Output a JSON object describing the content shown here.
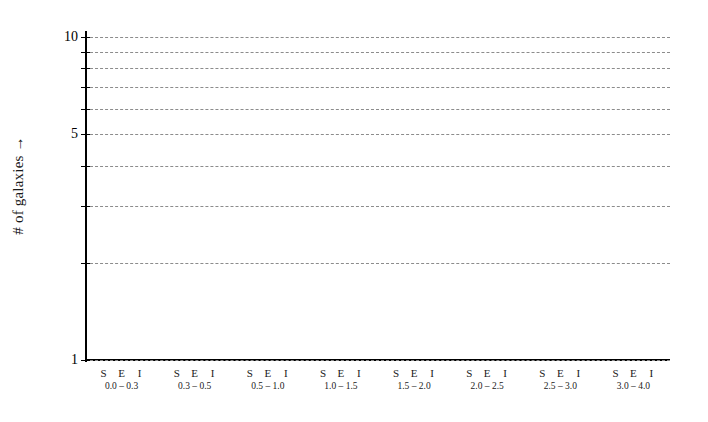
{
  "chart_data": {
    "type": "bar",
    "title": "",
    "subtitle": "",
    "xlabel": "",
    "ylabel": "# of galaxies →",
    "yscale": "log",
    "ylim": [
      1,
      10
    ],
    "grid": true,
    "legend": "none",
    "note": "Empty plot template: axes and gridlines drawn, no bars plotted (all series values are zero/absent).",
    "y_ticks": [
      1,
      2,
      3,
      4,
      5,
      6,
      7,
      8,
      9,
      10
    ],
    "y_tick_labels": [
      {
        "value": 10,
        "label": "10"
      },
      {
        "value": 9,
        "label": ""
      },
      {
        "value": 8,
        "label": ""
      },
      {
        "value": 7,
        "label": ""
      },
      {
        "value": 6,
        "label": ""
      },
      {
        "value": 5,
        "label": "5"
      },
      {
        "value": 4,
        "label": ""
      },
      {
        "value": 3,
        "label": ""
      },
      {
        "value": 2,
        "label": ""
      },
      {
        "value": 1,
        "label": "1"
      }
    ],
    "categories": [
      "0.0 – 0.3",
      "0.3 – 0.5",
      "0.5 – 1.0",
      "1.0 – 1.5",
      "1.5 – 2.0",
      "2.0 – 2.5",
      "2.5 – 3.0",
      "3.0 – 4.0"
    ],
    "subcategories": [
      "S",
      "E",
      "I"
    ],
    "series": [
      {
        "name": "S",
        "values": [
          null,
          null,
          null,
          null,
          null,
          null,
          null,
          null
        ]
      },
      {
        "name": "E",
        "values": [
          null,
          null,
          null,
          null,
          null,
          null,
          null,
          null
        ]
      },
      {
        "name": "I",
        "values": [
          null,
          null,
          null,
          null,
          null,
          null,
          null,
          null
        ]
      }
    ],
    "colors": {
      "axis": "#000000",
      "gridline": "#8c8c8c",
      "text": "#1a1a1a",
      "background": "#ffffff"
    }
  },
  "axes": {
    "y_title": "# of galaxies →"
  },
  "x_groups": [
    {
      "letters": [
        "S",
        "E",
        "I"
      ],
      "range": "0.0 – 0.3"
    },
    {
      "letters": [
        "S",
        "E",
        "I"
      ],
      "range": "0.3 – 0.5"
    },
    {
      "letters": [
        "S",
        "E",
        "I"
      ],
      "range": "0.5 – 1.0"
    },
    {
      "letters": [
        "S",
        "E",
        "I"
      ],
      "range": "1.0 – 1.5"
    },
    {
      "letters": [
        "S",
        "E",
        "I"
      ],
      "range": "1.5 – 2.0"
    },
    {
      "letters": [
        "S",
        "E",
        "I"
      ],
      "range": "2.0 – 2.5"
    },
    {
      "letters": [
        "S",
        "E",
        "I"
      ],
      "range": "2.5 – 3.0"
    },
    {
      "letters": [
        "S",
        "E",
        "I"
      ],
      "range": "3.0 – 4.0"
    }
  ]
}
